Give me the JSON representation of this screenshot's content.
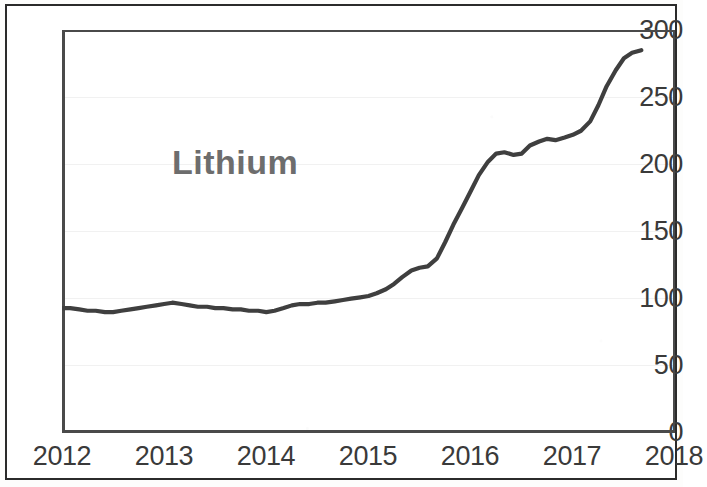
{
  "chart_data": {
    "type": "line",
    "title": "Lithium",
    "xlabel": "",
    "ylabel": "",
    "xlim": [
      2012,
      2018
    ],
    "ylim": [
      0,
      300
    ],
    "grid": true,
    "legend_position": "none",
    "y_ticks": [
      300,
      250,
      200,
      150,
      100,
      50,
      0
    ],
    "x_ticks": [
      "2012",
      "2013",
      "2014",
      "2015",
      "2016",
      "2017",
      "2018"
    ],
    "line_color": "#3f3f3f",
    "series": [
      {
        "name": "Lithium",
        "x": [
          2012.0,
          2012.08,
          2012.17,
          2012.25,
          2012.33,
          2012.42,
          2012.5,
          2012.58,
          2012.67,
          2012.75,
          2012.83,
          2012.92,
          2013.0,
          2013.08,
          2013.17,
          2013.25,
          2013.33,
          2013.42,
          2013.5,
          2013.58,
          2013.67,
          2013.75,
          2013.83,
          2013.92,
          2014.0,
          2014.08,
          2014.17,
          2014.25,
          2014.33,
          2014.42,
          2014.5,
          2014.58,
          2014.67,
          2014.75,
          2014.83,
          2014.92,
          2015.0,
          2015.08,
          2015.17,
          2015.25,
          2015.33,
          2015.42,
          2015.5,
          2015.58,
          2015.67,
          2015.75,
          2015.83,
          2015.92,
          2016.0,
          2016.08,
          2016.17,
          2016.25,
          2016.33,
          2016.42,
          2016.5,
          2016.58,
          2016.67,
          2016.75,
          2016.83,
          2016.92,
          2017.0,
          2017.08,
          2017.17,
          2017.25,
          2017.33,
          2017.42,
          2017.5,
          2017.58,
          2017.67
        ],
        "values": [
          93,
          93,
          92,
          91,
          91,
          90,
          90,
          91,
          92,
          93,
          94,
          95,
          96,
          97,
          96,
          95,
          94,
          94,
          93,
          93,
          92,
          92,
          91,
          91,
          90,
          91,
          93,
          95,
          96,
          96,
          97,
          97,
          98,
          99,
          100,
          101,
          102,
          104,
          107,
          111,
          116,
          121,
          123,
          124,
          130,
          142,
          155,
          168,
          180,
          192,
          202,
          208,
          209,
          207,
          208,
          214,
          217,
          219,
          218,
          220,
          222,
          225,
          232,
          244,
          258,
          270,
          279,
          283,
          285
        ]
      }
    ]
  },
  "axis": {
    "y_labels": [
      "300",
      "250",
      "200",
      "150",
      "100",
      "50",
      "0"
    ],
    "x_labels": [
      "2012",
      "2013",
      "2014",
      "2015",
      "2016",
      "2017",
      "2018"
    ]
  }
}
